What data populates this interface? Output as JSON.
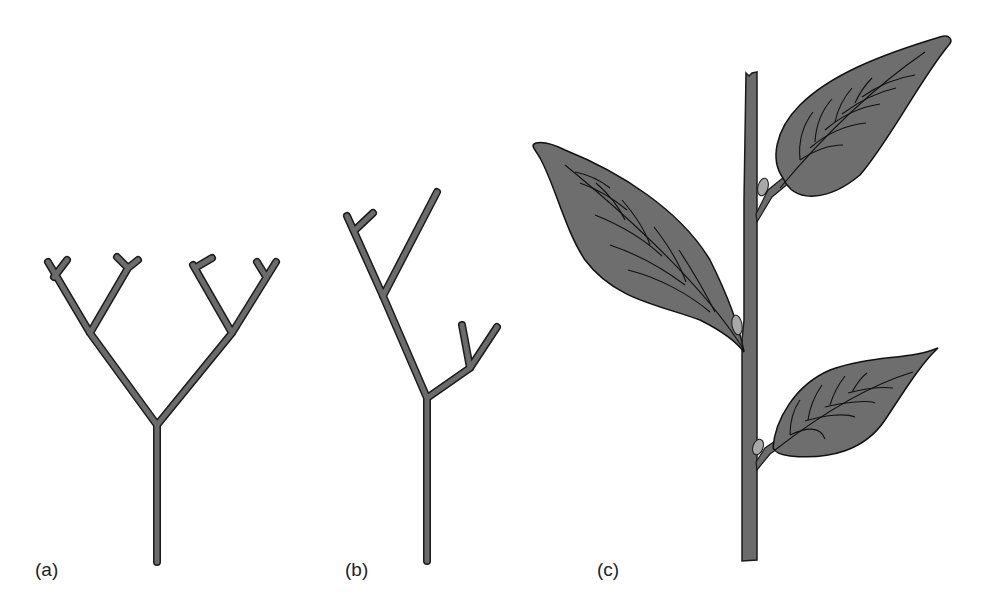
{
  "figure": {
    "panels": [
      {
        "id": "a",
        "label": "(a)",
        "description": "Dichotomous branching (symmetric Y forks)"
      },
      {
        "id": "b",
        "label": "(b)",
        "description": "Sympodial / unequal dichotomous branching"
      },
      {
        "id": "c",
        "label": "(c)",
        "description": "Stem with alternate leaves and axillary buds"
      }
    ]
  },
  "colors": {
    "background": "#ffffff",
    "stem_fill": "#6b6b6b",
    "stem_outline": "#1a1a1a",
    "leaf_fill": "#6e6e6e",
    "leaf_vein": "#111111",
    "bud_fill": "#a8a8a8",
    "label_text": "#222222"
  }
}
